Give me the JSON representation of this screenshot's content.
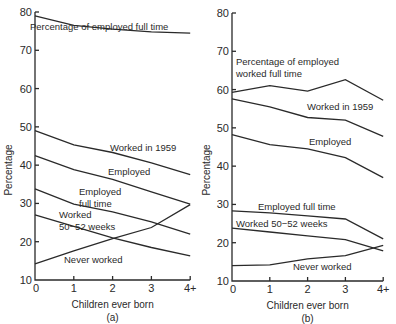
{
  "chart_data": [
    {
      "panel": "(a)",
      "type": "line",
      "xlabel": "Children ever born",
      "ylabel": "Percentage",
      "categories": [
        "0",
        "1",
        "2",
        "3",
        "4+"
      ],
      "ylim": [
        10,
        80
      ],
      "yticks": [
        10,
        20,
        30,
        40,
        50,
        60,
        70,
        80
      ],
      "grid": false,
      "series": [
        {
          "name": "Percentage of employed full time",
          "values": [
            79.0,
            76.5,
            75.5,
            74.8,
            74.5
          ],
          "label_pos": [
            30,
            30
          ],
          "label_lines": [
            "Percentage of employed full time"
          ]
        },
        {
          "name": "Worked in 1959",
          "values": [
            49.0,
            45.3,
            43.3,
            40.6,
            37.5
          ],
          "label_pos": [
            110,
            151
          ],
          "label_lines": [
            "Worked in 1959"
          ]
        },
        {
          "name": "Employed",
          "values": [
            42.5,
            38.8,
            36.3,
            33.0,
            29.8
          ],
          "label_pos": [
            108,
            175
          ],
          "label_lines": [
            "Employed"
          ]
        },
        {
          "name": "Employed full time",
          "values": [
            33.8,
            29.8,
            27.8,
            25.2,
            22.0
          ],
          "label_pos": [
            79,
            195
          ],
          "label_lines": [
            "Employed",
            "full time"
          ]
        },
        {
          "name": "Worked 50-52 weeks",
          "values": [
            27.0,
            24.0,
            21.0,
            18.5,
            16.3
          ],
          "label_pos": [
            59,
            218
          ],
          "label_lines": [
            "Worked",
            "50−52 weeks"
          ]
        },
        {
          "name": "Never worked",
          "values": [
            14.2,
            17.6,
            20.8,
            23.7,
            29.7
          ],
          "label_pos": [
            64,
            263
          ],
          "label_lines": [
            "Never worked"
          ]
        }
      ]
    },
    {
      "panel": "(b)",
      "type": "line",
      "xlabel": "Children ever born",
      "ylabel": "Percentage",
      "categories": [
        "0",
        "1",
        "2",
        "3",
        "4+"
      ],
      "ylim": [
        10,
        80
      ],
      "yticks": [
        10,
        20,
        30,
        40,
        50,
        60,
        70,
        80
      ],
      "grid": false,
      "series": [
        {
          "name": "Percentage of employed worked full time",
          "values": [
            59.3,
            61.0,
            59.6,
            62.6,
            57.2
          ],
          "label_pos": [
            236,
            65
          ],
          "label_lines": [
            "Percentage of employed",
            "worked full time"
          ]
        },
        {
          "name": "Worked in 1959",
          "values": [
            57.6,
            55.5,
            52.7,
            52.0,
            47.8
          ],
          "label_pos": [
            307,
            110
          ],
          "label_lines": [
            "Worked in 1959"
          ]
        },
        {
          "name": "Employed",
          "values": [
            48.2,
            45.6,
            44.5,
            42.2,
            37.0
          ],
          "label_pos": [
            309,
            145
          ],
          "label_lines": [
            "Employed"
          ]
        },
        {
          "name": "Employed full time",
          "values": [
            28.3,
            27.8,
            27.0,
            26.2,
            21.0
          ],
          "label_pos": [
            258,
            210
          ],
          "label_lines": [
            "Employed full time"
          ]
        },
        {
          "name": "Worked 50-52 weeks",
          "values": [
            23.8,
            22.8,
            21.8,
            20.8,
            17.9
          ],
          "label_pos": [
            236,
            227
          ],
          "label_lines": [
            "Worked 50−52 weeks"
          ]
        },
        {
          "name": "Never worked",
          "values": [
            14.0,
            14.2,
            15.8,
            16.6,
            19.3
          ],
          "label_pos": [
            293,
            270
          ],
          "label_lines": [
            "Never worked"
          ]
        }
      ]
    }
  ],
  "panels_layout": [
    {
      "x0": 35,
      "x_step": 38.8,
      "y_top": 12,
      "y_bottom": 280,
      "ylabel_x": 12,
      "ylabel_y": 170
    },
    {
      "x0": 232,
      "x_step": 37.8,
      "y_top": 13,
      "y_bottom": 281,
      "ylabel_x": 210,
      "ylabel_y": 170
    }
  ]
}
